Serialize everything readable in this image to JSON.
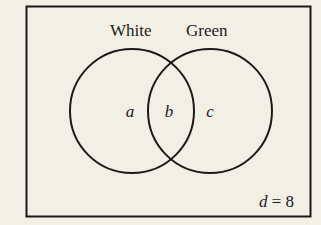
{
  "diagram": {
    "type": "venn",
    "sets": [
      {
        "name": "White",
        "label": "White"
      },
      {
        "name": "Green",
        "label": "Green"
      }
    ],
    "regions": {
      "white_only": "a",
      "both": "b",
      "green_only": "c"
    },
    "outside": {
      "variable": "d",
      "equals": "=",
      "value": "8"
    },
    "colors": {
      "background": "#f2efe5",
      "stroke": "#1a1a1a"
    }
  }
}
